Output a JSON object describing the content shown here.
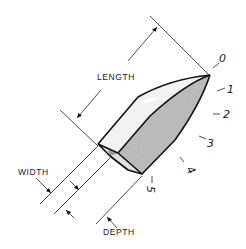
{
  "figure": {
    "dimension_labels": {
      "length": "LENGTH",
      "width": "WIDTH",
      "depth": "DEPTH"
    },
    "station_marks": [
      "0",
      "1",
      "2",
      "3",
      "4",
      "5"
    ],
    "colors": {
      "line": "#111111",
      "shaded_face": "#b8b8b8",
      "light_face": "#e6e6e6",
      "background": "#ffffff"
    }
  }
}
